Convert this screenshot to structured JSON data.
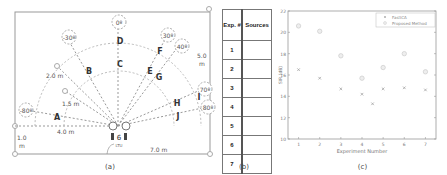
{
  "panel_a": {
    "caption": "(a)",
    "angles": [
      "-30º",
      "0º",
      "30º",
      "40º",
      "-80º",
      "70º",
      "80º"
    ],
    "source_labels": [
      "A",
      "B",
      "C",
      "D",
      "E",
      "F",
      "G",
      "H",
      "I",
      "J"
    ],
    "distances": {
      "r2": "2.0 m",
      "r15": "1.5 m",
      "left": "4.0 m",
      "height_left_1": "1.0",
      "height_left_2": "m",
      "right_1": "5.0",
      "right_2": "m",
      "bottom": "7.0 m"
    },
    "mic_label": "6",
    "array_label": "LTU"
  },
  "panel_b": {
    "caption": "(b)",
    "headers": [
      "Exp. #",
      "Sources"
    ],
    "rows": [
      "1",
      "2",
      "3",
      "4",
      "5",
      "6",
      "7"
    ]
  },
  "panel_c": {
    "caption": "(c)"
  },
  "chart_data": {
    "type": "scatter",
    "title": "",
    "xlabel": "Experiment Number",
    "ylabel": "SIR (dB)",
    "x": [
      1,
      2,
      3,
      4,
      5,
      6,
      7
    ],
    "xticks": [
      "1",
      "2",
      "3",
      "4",
      "5",
      "6",
      "7"
    ],
    "yticks": [
      "10",
      "12",
      "14",
      "16",
      "18",
      "20",
      "22"
    ],
    "ylim": [
      10,
      22
    ],
    "xlim": [
      0.5,
      7.5
    ],
    "grid": true,
    "legend_position": "upper right",
    "series": [
      {
        "name": "FastICA",
        "marker": "x",
        "values": [
          16.5,
          15.7,
          14.7,
          14.2,
          14.7,
          14.8,
          14.6
        ],
        "extra_points": [
          {
            "x": 4.5,
            "y": 13.3
          }
        ]
      },
      {
        "name": "Proposed Method",
        "marker": "o",
        "values": [
          20.6,
          20.1,
          17.8,
          15.7,
          16.7,
          18.0,
          16.3
        ]
      }
    ]
  }
}
